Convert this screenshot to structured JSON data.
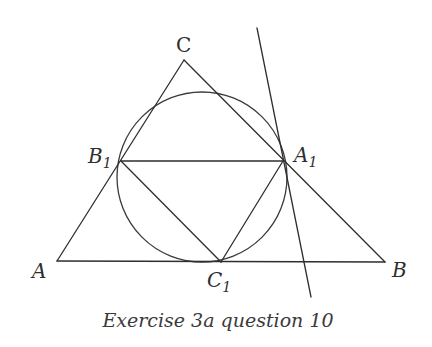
{
  "figure": {
    "caption": "Exercise 3a question 10",
    "colors": {
      "stroke": "#2e2e2e",
      "text": "#2e2e2e",
      "background": "#ffffff"
    },
    "points": {
      "A": {
        "label": "A",
        "subscript": "",
        "x": 57,
        "y": 261
      },
      "B": {
        "label": "B",
        "subscript": "",
        "x": 385,
        "y": 262
      },
      "C": {
        "label": "C",
        "subscript": "",
        "x": 184,
        "y": 60
      },
      "A1": {
        "label": "A",
        "subscript": "1",
        "x": 283,
        "y": 161
      },
      "B1": {
        "label": "B",
        "subscript": "1",
        "x": 121,
        "y": 161
      },
      "C1": {
        "label": "C",
        "subscript": "1",
        "x": 221,
        "y": 262
      }
    },
    "circle": {
      "cx": 202,
      "cy": 177,
      "r": 85
    },
    "tangent_line": {
      "x1": 257,
      "y1": 28,
      "x2": 311,
      "y2": 297
    },
    "segments": [
      [
        "A",
        "B"
      ],
      [
        "B",
        "C"
      ],
      [
        "C",
        "A"
      ],
      [
        "B1",
        "A1"
      ],
      [
        "B1",
        "C1"
      ],
      [
        "A1",
        "C1"
      ]
    ]
  }
}
